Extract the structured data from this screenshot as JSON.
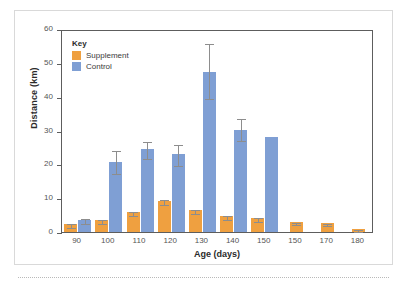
{
  "figure": {
    "legend_title": "Key",
    "legend": [
      {
        "label": "Supplement",
        "color": "#efa040",
        "swatch_name": "legend-swatch-supplement"
      },
      {
        "label": "Control",
        "color": "#7f9fd4",
        "swatch_name": "legend-swatch-control"
      }
    ]
  },
  "chart_data": {
    "type": "bar",
    "title": "",
    "xlabel": "Age (days)",
    "ylabel": "Distance (km)",
    "ylim": [
      0,
      60
    ],
    "yticks": [
      0,
      10,
      20,
      30,
      40,
      50,
      60
    ],
    "ytick_labels": [
      "0",
      "10",
      "20",
      "30",
      "40",
      "50",
      "60"
    ],
    "grid": false,
    "legend_position": "top-left-inside",
    "categories": [
      "90",
      "100",
      "110",
      "120",
      "130",
      "140",
      "150",
      "150",
      "170",
      "180"
    ],
    "series": [
      {
        "name": "Supplement",
        "color": "#efa040",
        "values": [
          2.4,
          3.6,
          5.8,
          9.3,
          6.5,
          4.7,
          4.1,
          2.9,
          2.7,
          0.9
        ],
        "error_low": [
          1.9,
          3.0,
          5.2,
          8.6,
          5.9,
          4.2,
          3.5,
          2.6,
          2.4,
          0.6
        ],
        "error_high": [
          3.0,
          4.1,
          6.4,
          10.1,
          7.1,
          5.3,
          4.8,
          3.2,
          3.0,
          1.2
        ]
      },
      {
        "name": "Control",
        "color": "#7f9fd4",
        "values": [
          3.6,
          20.7,
          24.5,
          23.2,
          47.4,
          30.1,
          28.0,
          null,
          null,
          null
        ],
        "error_low": [
          2.9,
          17.8,
          22.1,
          20.2,
          40.0,
          27.4,
          28.0,
          null,
          null,
          null
        ],
        "error_high": [
          4.5,
          24.5,
          27.3,
          26.3,
          56.3,
          34.1,
          28.0,
          null,
          null,
          null
        ]
      }
    ]
  }
}
